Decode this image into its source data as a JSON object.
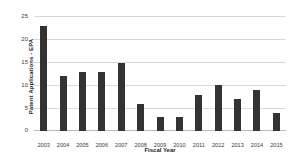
{
  "chart_data": {
    "type": "bar",
    "title": "",
    "subtitle": "",
    "xlabel": "Fiscal Year",
    "ylabel": "Patent Applications - EPA",
    "categories": [
      "2003",
      "2004",
      "2005",
      "2006",
      "2007",
      "2008",
      "2009",
      "2010",
      "2011",
      "2012",
      "2013",
      "2014",
      "2015"
    ],
    "values": [
      23,
      12,
      13,
      13,
      15,
      6,
      3,
      3,
      8,
      10,
      7,
      9,
      4
    ],
    "ylim": [
      0,
      25
    ],
    "yticks": [
      0,
      5,
      10,
      15,
      20,
      25
    ],
    "ytick_labels": [
      "0",
      "5",
      "10",
      "15",
      "20",
      "25"
    ],
    "grid": true,
    "grid_axis": "y",
    "legend": false,
    "legend_position": "none",
    "bar_color": "#333333",
    "gridline_color": "#d9d9d9",
    "background_color": "#ffffff",
    "series": [
      {
        "name": "Patent Applications - EPA",
        "values": [
          23,
          12,
          13,
          13,
          15,
          6,
          3,
          3,
          8,
          10,
          7,
          9,
          4
        ]
      }
    ]
  }
}
